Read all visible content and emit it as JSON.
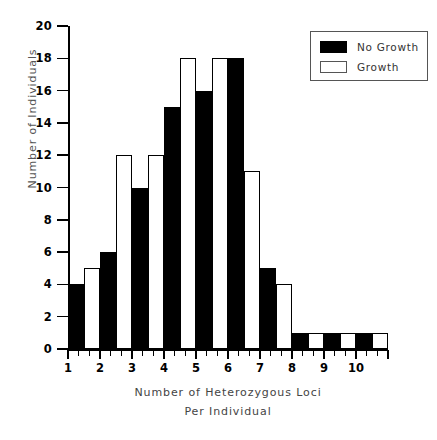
{
  "chart_data": {
    "type": "bar",
    "title": "",
    "xlabel": "Number of Heterozygous Loci",
    "xlabel_line2": "Per Individual",
    "ylabel": "Number of Individuals",
    "categories": [
      "1",
      "2",
      "3",
      "4",
      "5",
      "6",
      "7",
      "8",
      "9",
      "10"
    ],
    "series": [
      {
        "name": "No Growth",
        "color": "#000000",
        "values": [
          4,
          6,
          10,
          15,
          16,
          18,
          5,
          1,
          1,
          1
        ]
      },
      {
        "name": "Growth",
        "color": "#ffffff",
        "values": [
          5,
          12,
          12,
          18,
          18,
          11,
          4,
          1,
          1,
          1
        ]
      }
    ],
    "ylim": [
      0,
      20
    ],
    "ytick_step": 2,
    "ytick_labels": [
      "0",
      "2",
      "4",
      "6",
      "8",
      "10",
      "12",
      "14",
      "16",
      "18",
      "20"
    ],
    "grid": false,
    "legend_position": "top-right"
  },
  "legend": {
    "items": [
      {
        "label": "No Growth",
        "swatch": "black"
      },
      {
        "label": "Growth",
        "swatch": "white"
      }
    ]
  }
}
